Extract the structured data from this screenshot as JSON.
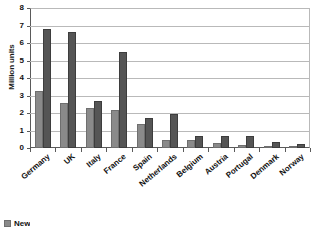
{
  "chart_data": {
    "type": "bar",
    "title": "",
    "xlabel": "",
    "ylabel": "Million units",
    "ylim": [
      0,
      8
    ],
    "ytick_labels": [
      "8",
      "7",
      "6",
      "5",
      "4",
      "3",
      "2",
      "1",
      "0"
    ],
    "ytick_values": [
      8,
      7,
      6,
      5,
      4,
      3,
      2,
      1,
      0
    ],
    "grid": true,
    "legend_position": "bottom-left",
    "categories": [
      "Germany",
      "UK",
      "Italy",
      "France",
      "Spain",
      "Netherlands",
      "Belgium",
      "Austria",
      "Portugal",
      "Denmark",
      "Norway"
    ],
    "series": [
      {
        "name": "New",
        "color": "#8a8a8a",
        "values": [
          3.25,
          2.6,
          2.3,
          2.15,
          1.35,
          0.48,
          0.45,
          0.3,
          0.2,
          0.12,
          0.07
        ]
      },
      {
        "name": "Used",
        "color": "#555555",
        "values": [
          6.8,
          6.65,
          2.7,
          5.5,
          1.7,
          1.92,
          0.7,
          0.68,
          0.67,
          0.35,
          0.25
        ]
      }
    ]
  },
  "legend": {
    "items": [
      {
        "label": "New",
        "color": "#8a8a8a"
      }
    ]
  }
}
